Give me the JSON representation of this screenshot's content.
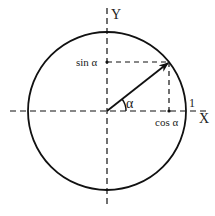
{
  "diagram": {
    "labels": {
      "y_axis": "Y",
      "x_axis": "X",
      "sin": "sin α",
      "cos": "cos α",
      "angle": "α",
      "radius": "1"
    },
    "colors": {
      "stroke": "#111111",
      "background": "#ffffff"
    },
    "geometry": {
      "center": [
        107,
        111
      ],
      "radius": 79,
      "point": [
        169,
        62
      ]
    }
  }
}
